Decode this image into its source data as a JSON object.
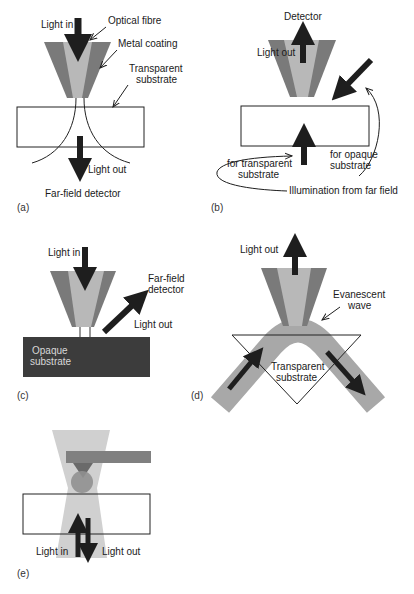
{
  "colors": {
    "metal_coating": "#7a7a7a",
    "fibre_core": "#b8b8b8",
    "arrow": "#1e1e1e",
    "opaque_substrate": "#3c3c3c",
    "substrate_outline": "#222222",
    "waveguide": "#a8a8a8",
    "cantilever": "#808080",
    "beam": "#d0d0d0"
  },
  "panels": {
    "a": {
      "letter": "(a)",
      "light_in": "Light in",
      "optical_fibre": "Optical fibre",
      "metal_coating": "Metal coating",
      "transparent_substrate_line1": "Transparent",
      "transparent_substrate_line2": "substrate",
      "light_out": "Light out",
      "far_field_detector": "Far-field detector"
    },
    "b": {
      "letter": "(b)",
      "detector": "Detector",
      "light_out": "Light out",
      "for_transparent_line1": "for transparent",
      "for_transparent_line2": "substrate",
      "for_opaque_line1": "for opaque",
      "for_opaque_line2": "substrate",
      "illumination": "Illumination from far field"
    },
    "c": {
      "letter": "(c)",
      "light_in": "Light in",
      "far_field_line1": "Far-field",
      "far_field_line2": "detector",
      "light_out": "Light out",
      "opaque_line1": "Opaque",
      "opaque_line2": "substrate"
    },
    "d": {
      "letter": "(d)",
      "light_out": "Light out",
      "evanescent_line1": "Evanescent",
      "evanescent_line2": "wave",
      "transparent_line1": "Transparent",
      "transparent_line2": "substrate"
    },
    "e": {
      "letter": "(e)",
      "light_in": "Light in",
      "light_out": "Light out"
    }
  }
}
